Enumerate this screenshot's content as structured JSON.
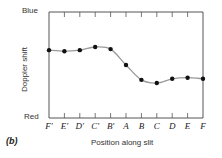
{
  "chart_data": {
    "type": "line",
    "title": "",
    "xlabel": "Position along slit",
    "ylabel": "Doppler shift",
    "y_top_label": "Blue",
    "y_bottom_label": "Red",
    "panel_label": "(b)",
    "categories": [
      "F'",
      "E'",
      "D'",
      "C'",
      "B'",
      "A",
      "B",
      "C",
      "D",
      "E",
      "F"
    ],
    "series": [
      {
        "name": "Doppler shift",
        "values": [
          0.64,
          0.63,
          0.64,
          0.67,
          0.65,
          0.5,
          0.36,
          0.33,
          0.37,
          0.38,
          0.37
        ]
      }
    ],
    "ylim": [
      0,
      1
    ],
    "grid": false,
    "legend": "none",
    "smooth_curve": true,
    "colors": {
      "curve": "#999999",
      "points": "#111111",
      "axis": "#555555"
    }
  }
}
